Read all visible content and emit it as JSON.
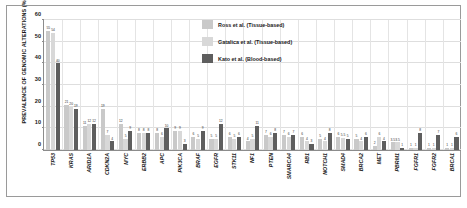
{
  "chart_data": {
    "type": "bar",
    "title": "",
    "xlabel": "",
    "ylabel": "PREVALENCE OF GENOMIC ALTERATIONS (%)",
    "ylim": [
      0,
      60
    ],
    "yticks": [
      0,
      10,
      20,
      30,
      40,
      50,
      60
    ],
    "grid": true,
    "legend_position": "top-right",
    "categories": [
      "TP53",
      "KRAS",
      "ARID1A",
      "CDKN2A",
      "MYC",
      "ERBB2",
      "APC",
      "PIK3CA",
      "BRAF",
      "EGFR",
      "STK11",
      "NF1",
      "PTEN",
      "SMARCA4",
      "RB1",
      "NOTCH1",
      "SMAD4",
      "BRCA2",
      "MET",
      "PBRM1",
      "FGFR1",
      "FGFR2",
      "BRCA1"
    ],
    "series": [
      {
        "name": "Ross et al. (Tissue-based)",
        "color": "#c9c9c9",
        "values": [
          55,
          21,
          11,
          19,
          12,
          8,
          8,
          9,
          6,
          5,
          6,
          4,
          7,
          7,
          6,
          5,
          6,
          5,
          2,
          3.5,
          1,
          1,
          1
        ],
        "labels": [
          "55",
          "21",
          "11",
          "19",
          "12",
          "8",
          "8",
          "9",
          "6",
          "5",
          "6",
          "4",
          "7",
          "7",
          "6",
          "5",
          "6",
          "5",
          "2",
          "3.5",
          "1",
          "1",
          "1"
        ]
      },
      {
        "name": "Gatalica et al. (Tissue-based)",
        "color": "#d8d8d8",
        "values": [
          54,
          20,
          12,
          7,
          5,
          8,
          6,
          9,
          5,
          5,
          5,
          5,
          6,
          6,
          4,
          4,
          5.5,
          4,
          6,
          3.5,
          1,
          1,
          1
        ],
        "labels": [
          "54",
          "20",
          "12",
          "7",
          "5",
          "8",
          "6",
          "9",
          "5",
          "5",
          "5",
          "5",
          "6",
          "6",
          "4",
          "4",
          "5.5",
          "4",
          "6",
          "3.5",
          "1",
          "1",
          "1"
        ]
      },
      {
        "name": "Kato et al. (Blood-based)",
        "color": "#5e5e5e",
        "values": [
          40,
          19,
          12,
          4,
          9,
          8,
          10,
          3,
          9,
          12,
          6,
          11,
          8,
          7,
          3,
          8,
          5,
          6,
          4,
          1,
          8,
          7,
          6
        ],
        "labels": [
          "40",
          "19",
          "12",
          "4",
          "9",
          "8",
          "10",
          "3",
          "9",
          "12",
          "6",
          "11",
          "8",
          "7",
          "3",
          "8",
          "5",
          "6",
          "4",
          "1",
          "8",
          "7",
          "6"
        ]
      }
    ]
  }
}
